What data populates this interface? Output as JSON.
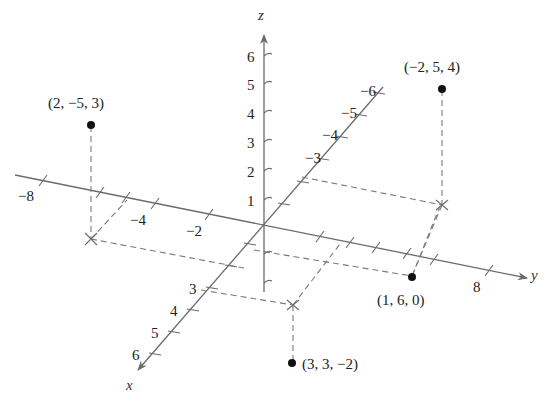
{
  "diagram": {
    "axes": {
      "x": {
        "name": "x",
        "tick_labels": [
          "3",
          "4",
          "5",
          "6"
        ]
      },
      "y": {
        "name": "y",
        "tick_labels": [
          "-8",
          "-4",
          "-2",
          "8"
        ]
      },
      "z": {
        "name": "z",
        "tick_labels": [
          "1",
          "2",
          "3",
          "4",
          "5",
          "6"
        ]
      },
      "neg_x": {
        "tick_labels": [
          "-3",
          "-4",
          "-5",
          "-6"
        ]
      }
    },
    "axis_label_text": {
      "x": "x",
      "y": "y",
      "z": "z",
      "x3": "3",
      "x4": "4",
      "x5": "5",
      "x6": "6",
      "xn3": "−3",
      "xn4": "−4",
      "xn5": "−5",
      "xn6": "−6",
      "yn8": "−8",
      "yn4": "−4",
      "yn2": "−2",
      "y8": "8",
      "z1": "1",
      "z2": "2",
      "z3": "3",
      "z4": "4",
      "z5": "5",
      "z6": "6"
    },
    "points": [
      {
        "label": "(2, −5, 3)",
        "x": 2,
        "y": -5,
        "z": 3
      },
      {
        "label": "(−2, 5, 4)",
        "x": -2,
        "y": 5,
        "z": 4
      },
      {
        "label": "(1, 6, 0)",
        "x": 1,
        "y": 6,
        "z": 0
      },
      {
        "label": "(3, 3, −2)",
        "x": 3,
        "y": 3,
        "z": -2
      }
    ],
    "colors": {
      "axis": "#6b6b6b",
      "dashed": "#7a7a7a",
      "point": "#111111",
      "text": "#222222"
    }
  }
}
